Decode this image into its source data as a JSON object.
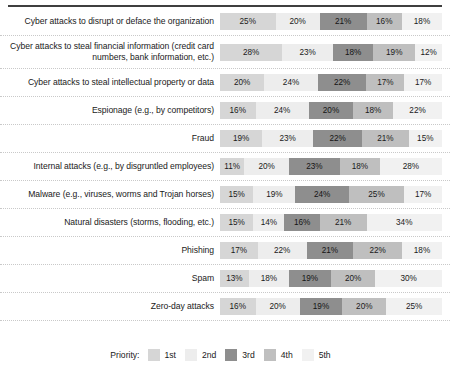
{
  "chart_data": {
    "type": "bar",
    "subtype": "stacked-horizontal-100",
    "title": "",
    "xlabel": "",
    "ylabel": "",
    "grid": false,
    "legend_position": "bottom",
    "legend_title": "Priority:",
    "series": [
      {
        "name": "1st",
        "color": "#d6d6d6",
        "values": [
          25,
          28,
          20,
          16,
          19,
          11,
          15,
          15,
          17,
          13,
          16
        ]
      },
      {
        "name": "2nd",
        "color": "#ededed",
        "values": [
          20,
          23,
          24,
          24,
          23,
          20,
          19,
          14,
          22,
          18,
          20
        ]
      },
      {
        "name": "3rd",
        "color": "#8e8e8e",
        "values": [
          21,
          18,
          22,
          20,
          22,
          23,
          24,
          16,
          21,
          19,
          19
        ]
      },
      {
        "name": "4th",
        "color": "#bfbfbf",
        "values": [
          16,
          19,
          17,
          18,
          21,
          18,
          25,
          21,
          22,
          20,
          20
        ]
      },
      {
        "name": "5th",
        "color": "#f1f1f1",
        "values": [
          18,
          12,
          17,
          22,
          15,
          28,
          17,
          34,
          18,
          30,
          25
        ]
      }
    ],
    "categories": [
      "Cyber attacks to disrupt or deface the organization",
      "Cyber attacks to steal financial information (credit card numbers, bank information, etc.)",
      "Cyber attacks to steal intellectual property or data",
      "Espionage (e.g., by competitors)",
      "Fraud",
      "Internal attacks (e.g., by disgruntled employees)",
      "Malware (e.g., viruses, worms and Trojan horses)",
      "Natural disasters (storms, flooding, etc.)",
      "Phishing",
      "Spam",
      "Zero-day attacks"
    ]
  },
  "rows": [
    {
      "label": "Cyber attacks to disrupt or deface the organization",
      "segments": [
        {
          "priority": "1st",
          "label": "25%",
          "value": 25
        },
        {
          "priority": "2nd",
          "label": "20%",
          "value": 20
        },
        {
          "priority": "3rd",
          "label": "21%",
          "value": 21
        },
        {
          "priority": "4th",
          "label": "16%",
          "value": 16
        },
        {
          "priority": "5th",
          "label": "18%",
          "value": 18
        }
      ]
    },
    {
      "label": "Cyber attacks to steal financial information (credit card numbers, bank information, etc.)",
      "segments": [
        {
          "priority": "1st",
          "label": "28%",
          "value": 28
        },
        {
          "priority": "2nd",
          "label": "23%",
          "value": 23
        },
        {
          "priority": "3rd",
          "label": "18%",
          "value": 18
        },
        {
          "priority": "4th",
          "label": "19%",
          "value": 19
        },
        {
          "priority": "5th",
          "label": "12%",
          "value": 12
        }
      ]
    },
    {
      "label": "Cyber attacks to steal intellectual property or data",
      "segments": [
        {
          "priority": "1st",
          "label": "20%",
          "value": 20
        },
        {
          "priority": "2nd",
          "label": "24%",
          "value": 24
        },
        {
          "priority": "3rd",
          "label": "22%",
          "value": 22
        },
        {
          "priority": "4th",
          "label": "17%",
          "value": 17
        },
        {
          "priority": "5th",
          "label": "17%",
          "value": 17
        }
      ]
    },
    {
      "label": "Espionage (e.g., by competitors)",
      "segments": [
        {
          "priority": "1st",
          "label": "16%",
          "value": 16
        },
        {
          "priority": "2nd",
          "label": "24%",
          "value": 24
        },
        {
          "priority": "3rd",
          "label": "20%",
          "value": 20
        },
        {
          "priority": "4th",
          "label": "18%",
          "value": 18
        },
        {
          "priority": "5th",
          "label": "22%",
          "value": 22
        }
      ]
    },
    {
      "label": "Fraud",
      "segments": [
        {
          "priority": "1st",
          "label": "19%",
          "value": 19
        },
        {
          "priority": "2nd",
          "label": "23%",
          "value": 23
        },
        {
          "priority": "3rd",
          "label": "22%",
          "value": 22
        },
        {
          "priority": "4th",
          "label": "21%",
          "value": 21
        },
        {
          "priority": "5th",
          "label": "15%",
          "value": 15
        }
      ]
    },
    {
      "label": "Internal attacks (e.g., by disgruntled employees)",
      "segments": [
        {
          "priority": "1st",
          "label": "11%",
          "value": 11
        },
        {
          "priority": "2nd",
          "label": "20%",
          "value": 20
        },
        {
          "priority": "3rd",
          "label": "23%",
          "value": 23
        },
        {
          "priority": "4th",
          "label": "18%",
          "value": 18
        },
        {
          "priority": "5th",
          "label": "28%",
          "value": 28
        }
      ]
    },
    {
      "label": "Malware (e.g., viruses, worms and Trojan horses)",
      "segments": [
        {
          "priority": "1st",
          "label": "15%",
          "value": 15
        },
        {
          "priority": "2nd",
          "label": "19%",
          "value": 19
        },
        {
          "priority": "3rd",
          "label": "24%",
          "value": 24
        },
        {
          "priority": "4th",
          "label": "25%",
          "value": 25
        },
        {
          "priority": "5th",
          "label": "17%",
          "value": 17
        }
      ]
    },
    {
      "label": "Natural disasters (storms, flooding, etc.)",
      "segments": [
        {
          "priority": "1st",
          "label": "15%",
          "value": 15
        },
        {
          "priority": "2nd",
          "label": "14%",
          "value": 14
        },
        {
          "priority": "3rd",
          "label": "16%",
          "value": 16
        },
        {
          "priority": "4th",
          "label": "21%",
          "value": 21
        },
        {
          "priority": "5th",
          "label": "34%",
          "value": 34
        }
      ]
    },
    {
      "label": "Phishing",
      "segments": [
        {
          "priority": "1st",
          "label": "17%",
          "value": 17
        },
        {
          "priority": "2nd",
          "label": "22%",
          "value": 22
        },
        {
          "priority": "3rd",
          "label": "21%",
          "value": 21
        },
        {
          "priority": "4th",
          "label": "22%",
          "value": 22
        },
        {
          "priority": "5th",
          "label": "18%",
          "value": 18
        }
      ]
    },
    {
      "label": "Spam",
      "segments": [
        {
          "priority": "1st",
          "label": "13%",
          "value": 13
        },
        {
          "priority": "2nd",
          "label": "18%",
          "value": 18
        },
        {
          "priority": "3rd",
          "label": "19%",
          "value": 19
        },
        {
          "priority": "4th",
          "label": "20%",
          "value": 20
        },
        {
          "priority": "5th",
          "label": "30%",
          "value": 30
        }
      ]
    },
    {
      "label": "Zero-day attacks",
      "segments": [
        {
          "priority": "1st",
          "label": "16%",
          "value": 16
        },
        {
          "priority": "2nd",
          "label": "20%",
          "value": 20
        },
        {
          "priority": "3rd",
          "label": "19%",
          "value": 19
        },
        {
          "priority": "4th",
          "label": "20%",
          "value": 20
        },
        {
          "priority": "5th",
          "label": "25%",
          "value": 25
        }
      ]
    }
  ],
  "legend": {
    "title": "Priority:",
    "items": [
      {
        "label": "1st",
        "color": "#d6d6d6"
      },
      {
        "label": "2nd",
        "color": "#ededed"
      },
      {
        "label": "3rd",
        "color": "#8e8e8e"
      },
      {
        "label": "4th",
        "color": "#bfbfbf"
      },
      {
        "label": "5th",
        "color": "#f1f1f1"
      }
    ]
  }
}
